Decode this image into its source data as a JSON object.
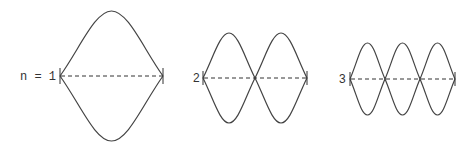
{
  "diagrams": [
    {
      "label": "n = 1",
      "harmonic": 1,
      "x0": 60,
      "x1": 163,
      "cy": 76,
      "amp": 65
    },
    {
      "label": "2",
      "harmonic": 2,
      "x0": 203,
      "x1": 307,
      "cy": 78,
      "amp": 45
    },
    {
      "label": "3",
      "harmonic": 3,
      "x0": 350,
      "x1": 455,
      "cy": 79,
      "amp": 36
    }
  ],
  "colors": {
    "wave": "#444444",
    "axis": "#333333"
  }
}
